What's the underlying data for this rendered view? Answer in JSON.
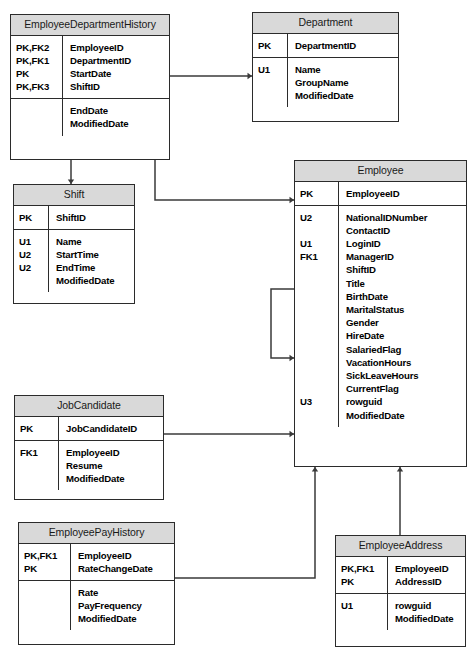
{
  "diagram": {
    "type": "entity-relationship-diagram",
    "notation": "IDEF1X / crow-less arrow",
    "colors": {
      "header_fill": "#d9d9d9",
      "body_fill": "#ffffff",
      "border": "#2b2b2b",
      "line": "#3a3a3a",
      "text": "#000000",
      "title_text": "#1a1a1a"
    }
  },
  "entities": [
    {
      "id": "employee_department_history",
      "name": "EmployeeDepartmentHistory",
      "x": 10,
      "y": 14,
      "width": 160,
      "height": 146,
      "key_col_width": 52,
      "primary": {
        "keys": [
          "PK,FK2",
          "PK,FK1",
          "PK",
          "PK,FK3"
        ],
        "attributes": [
          "EmployeeID",
          "DepartmentID",
          "StartDate",
          "ShiftID"
        ]
      },
      "secondary": {
        "keys": [
          "",
          ""
        ],
        "attributes": [
          "EndDate",
          "ModifiedDate"
        ]
      }
    },
    {
      "id": "department",
      "name": "Department",
      "x": 252,
      "y": 12,
      "width": 147,
      "height": 110,
      "key_col_width": 35,
      "primary": {
        "keys": [
          "PK"
        ],
        "attributes": [
          "DepartmentID"
        ]
      },
      "secondary": {
        "keys": [
          "U1",
          "",
          ""
        ],
        "attributes": [
          "Name",
          "GroupName",
          "ModifiedDate"
        ]
      }
    },
    {
      "id": "shift",
      "name": "Shift",
      "x": 13,
      "y": 184,
      "width": 122,
      "height": 120,
      "key_col_width": 35,
      "primary": {
        "keys": [
          "PK"
        ],
        "attributes": [
          "ShiftID"
        ]
      },
      "secondary": {
        "keys": [
          "U1",
          "U2",
          "U2",
          ""
        ],
        "attributes": [
          "Name",
          "StartTime",
          "EndTime",
          "ModifiedDate"
        ]
      }
    },
    {
      "id": "employee",
      "name": "Employee",
      "x": 294,
      "y": 160,
      "width": 173,
      "height": 307,
      "key_col_width": 44,
      "primary": {
        "keys": [
          "PK"
        ],
        "attributes": [
          "EmployeeID"
        ]
      },
      "secondary": {
        "keys": [
          "U2",
          "",
          "U1",
          "FK1",
          "",
          "",
          "",
          "",
          "",
          "",
          "",
          "",
          "",
          "",
          "U3",
          ""
        ],
        "attributes": [
          "NationalIDNumber",
          "ContactID",
          "LoginID",
          "ManagerID",
          "ShiftID",
          "Title",
          "BirthDate",
          "MaritalStatus",
          "Gender",
          "HireDate",
          "SalariedFlag",
          "VacationHours",
          "SickLeaveHours",
          "CurrentFlag",
          "rowguid",
          "ModifiedDate"
        ]
      }
    },
    {
      "id": "job_candidate",
      "name": "JobCandidate",
      "x": 14,
      "y": 395,
      "width": 150,
      "height": 105,
      "key_col_width": 44,
      "primary": {
        "keys": [
          "PK"
        ],
        "attributes": [
          "JobCandidateID"
        ]
      },
      "secondary": {
        "keys": [
          "FK1",
          "",
          ""
        ],
        "attributes": [
          "EmployeeID",
          "Resume",
          "ModifiedDate"
        ]
      }
    },
    {
      "id": "employee_pay_history",
      "name": "EmployeePayHistory",
      "x": 18,
      "y": 522,
      "width": 157,
      "height": 123,
      "key_col_width": 52,
      "primary": {
        "keys": [
          "PK,FK1",
          "PK"
        ],
        "attributes": [
          "EmployeeID",
          "RateChangeDate"
        ]
      },
      "secondary": {
        "keys": [
          "",
          "",
          ""
        ],
        "attributes": [
          "Rate",
          "PayFrequency",
          "ModifiedDate"
        ]
      }
    },
    {
      "id": "employee_address",
      "name": "EmployeeAddress",
      "x": 335,
      "y": 535,
      "width": 131,
      "height": 112,
      "key_col_width": 52,
      "primary": {
        "keys": [
          "PK,FK1",
          "PK"
        ],
        "attributes": [
          "EmployeeID",
          "AddressID"
        ]
      },
      "secondary": {
        "keys": [
          "U1",
          ""
        ],
        "attributes": [
          "rowguid",
          "ModifiedDate"
        ]
      }
    }
  ],
  "relationships": [
    {
      "id": "edh-to-department",
      "from": "employee_department_history",
      "to": "department",
      "to_attribute": "Name",
      "path": "M 170 76 L 252 76",
      "arrow": {
        "x": 252,
        "y": 76,
        "dir": "right"
      }
    },
    {
      "id": "edh-to-shift",
      "from": "employee_department_history",
      "to": "shift",
      "to_attribute": "ShiftID",
      "path": "M 71 160 L 71 184",
      "arrow": {
        "x": 71,
        "y": 184,
        "dir": "down"
      }
    },
    {
      "id": "edh-to-employee",
      "from": "employee_department_history",
      "to": "employee",
      "to_attribute": "EmployeeID",
      "path": "M 155 160 L 155 200 L 294 200",
      "arrow": {
        "x": 294,
        "y": 200,
        "dir": "right"
      }
    },
    {
      "id": "employee-self-manager",
      "from": "employee",
      "to": "employee",
      "to_attribute": "EmployeeID",
      "path": "M 294 289 L 271 289 L 271 358 L 294 358",
      "arrow": {
        "x": 294,
        "y": 358,
        "dir": "right"
      }
    },
    {
      "id": "jobcandidate-to-employee",
      "from": "job_candidate",
      "to": "employee",
      "to_attribute": "rowguid",
      "path": "M 164 434 L 294 434",
      "arrow": {
        "x": 294,
        "y": 434,
        "dir": "right"
      }
    },
    {
      "id": "payhistory-to-employee",
      "from": "employee_pay_history",
      "to": "employee",
      "to_attribute": "EmployeeID",
      "path": "M 175 578 L 315 578 L 315 467",
      "arrow": {
        "x": 315,
        "y": 467,
        "dir": "up"
      }
    },
    {
      "id": "address-to-employee",
      "from": "employee_address",
      "to": "employee",
      "to_attribute": "EmployeeID",
      "path": "M 400 535 L 400 467",
      "arrow": {
        "x": 400,
        "y": 467,
        "dir": "up"
      }
    }
  ]
}
